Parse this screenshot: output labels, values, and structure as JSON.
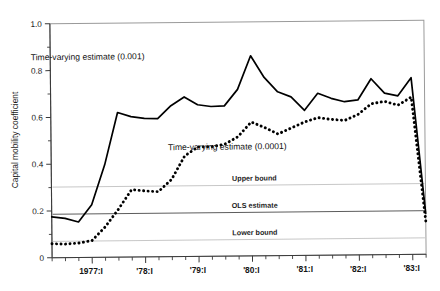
{
  "chart_data": {
    "type": "line",
    "title": "",
    "xlabel": "",
    "ylabel": "Capital mobility coefficient",
    "ylim": [
      0,
      1.0
    ],
    "ytick_labels": [
      "0",
      "0.2",
      "0.4",
      "0.6",
      "0.8",
      "1.0"
    ],
    "ytick_values": [
      0,
      0.2,
      0.4,
      0.6,
      0.8,
      1.0
    ],
    "yminor_values": [
      0.1,
      0.3,
      0.5,
      0.7,
      0.9
    ],
    "xtick_labels": [
      "1977:I",
      "'78:I",
      "'79:I",
      "'80:I",
      "'81:I",
      "'82:I",
      "'83:I"
    ],
    "xtick_values": [
      1977.0,
      1978.0,
      1979.0,
      1980.0,
      1981.0,
      1982.0,
      1983.0
    ],
    "xlim": [
      1976.25,
      1983.25
    ],
    "grid": false,
    "legend_position": "inline-annotations",
    "series": [
      {
        "name": "Time-varying estimate (0.001)",
        "style": "solid",
        "label_position": {
          "x": 1976.95,
          "y": 0.845
        },
        "x": [
          1976.25,
          1976.5,
          1976.75,
          1977.0,
          1977.25,
          1977.5,
          1977.75,
          1978.0,
          1978.25,
          1978.5,
          1978.75,
          1979.0,
          1979.25,
          1979.5,
          1979.75,
          1980.0,
          1980.25,
          1980.5,
          1980.75,
          1981.0,
          1981.25,
          1981.5,
          1981.75,
          1982.0,
          1982.25,
          1982.5,
          1982.75,
          1983.0,
          1983.25
        ],
        "values": [
          0.175,
          0.168,
          0.152,
          0.225,
          0.395,
          0.618,
          0.6,
          0.592,
          0.59,
          0.645,
          0.682,
          0.648,
          0.64,
          0.642,
          0.712,
          0.855,
          0.762,
          0.7,
          0.678,
          0.62,
          0.692,
          0.67,
          0.655,
          0.662,
          0.752,
          0.69,
          0.678,
          0.755,
          0.175
        ]
      },
      {
        "name": "Time-varying estimate (0.0001)",
        "style": "dotted",
        "label_position": {
          "x": 1979.55,
          "y": 0.455
        },
        "x": [
          1976.25,
          1976.5,
          1976.75,
          1977.0,
          1977.25,
          1977.5,
          1977.75,
          1978.0,
          1978.25,
          1978.5,
          1978.75,
          1979.0,
          1979.25,
          1979.5,
          1979.75,
          1980.0,
          1980.25,
          1980.5,
          1980.75,
          1981.0,
          1981.25,
          1981.5,
          1981.75,
          1982.0,
          1982.25,
          1982.5,
          1982.75,
          1983.0,
          1983.25
        ],
        "values": [
          0.06,
          0.058,
          0.062,
          0.072,
          0.13,
          0.205,
          0.288,
          0.282,
          0.278,
          0.33,
          0.43,
          0.468,
          0.468,
          0.478,
          0.51,
          0.572,
          0.548,
          0.52,
          0.545,
          0.57,
          0.588,
          0.58,
          0.575,
          0.6,
          0.645,
          0.655,
          0.638,
          0.672,
          0.142
        ]
      }
    ],
    "reference_lines": [
      {
        "label": "Upper bound",
        "value": 0.302,
        "style": "light",
        "label_x": 1980.05
      },
      {
        "label": "OLS estimate",
        "value": 0.186,
        "style": "dark",
        "label_x": 1980.05
      },
      {
        "label": "Lower bound",
        "value": 0.07,
        "style": "light",
        "label_x": 1980.05
      }
    ]
  }
}
